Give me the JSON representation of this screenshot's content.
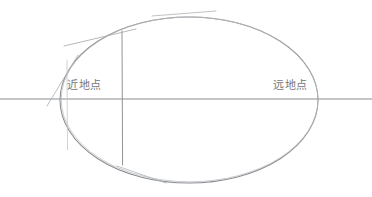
{
  "diagram": {
    "background_color": "#ffffff",
    "stroke_color": "#8a8d91",
    "faint_stroke_color": "#b8bbbf",
    "text_color": "#74767a",
    "width": 372,
    "height": 197,
    "labels": {
      "perigee": "近地点",
      "apogee": "远地点"
    },
    "geometry": {
      "ellipse": {
        "cx": 189,
        "cy": 100,
        "rx": 129,
        "ry": 83
      },
      "major_axis_line": {
        "x1": 0,
        "y1": 99,
        "x2": 372,
        "y2": 99
      },
      "vertical_chord": {
        "x1": 122,
        "y1": 31,
        "x2": 122,
        "y2": 165
      },
      "faint_vertical": {
        "x1": 67,
        "y1": 60,
        "x2": 67,
        "y2": 150
      },
      "tangent_upper_left": {
        "x1": 64,
        "y1": 46,
        "x2": 136,
        "y2": 29
      },
      "tangent_top": {
        "x1": 152,
        "y1": 16,
        "x2": 216,
        "y2": 11
      },
      "tangent_bottom_left": {
        "x1": 117,
        "y1": 166,
        "x2": 166,
        "y2": 183
      },
      "slant_left": {
        "x1": 47,
        "y1": 106,
        "x2": 78,
        "y2": 55
      }
    }
  }
}
